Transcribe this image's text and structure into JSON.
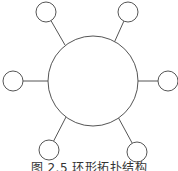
{
  "diagram": {
    "type": "star-topology",
    "hub": {
      "cx": 93,
      "cy": 81,
      "r": 45
    },
    "nodes": [
      {
        "id": "top-left",
        "cx": 46,
        "cy": 12,
        "r": 10,
        "x1": 65,
        "y1": 45
      },
      {
        "id": "top-right",
        "cx": 128,
        "cy": 12,
        "r": 10,
        "x1": 114,
        "y1": 43
      },
      {
        "id": "left",
        "cx": 13,
        "cy": 81,
        "r": 10,
        "x1": 48,
        "y1": 81
      },
      {
        "id": "right",
        "cx": 168,
        "cy": 81,
        "r": 10,
        "x1": 138,
        "y1": 81
      },
      {
        "id": "bottom-left",
        "cx": 49,
        "cy": 150,
        "r": 10,
        "x1": 66,
        "y1": 117
      },
      {
        "id": "bottom-right",
        "cx": 137,
        "cy": 152,
        "r": 10,
        "x1": 118,
        "y1": 117
      }
    ],
    "stroke": "#555555"
  },
  "caption": "图 2.5  环形拓扑结构"
}
